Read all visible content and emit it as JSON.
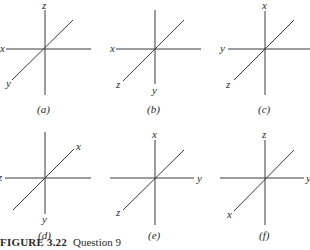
{
  "figure": {
    "caption_label": "FIGURE 3.22",
    "caption_text": "Question 9",
    "panels": [
      {
        "id": "a",
        "label": "(a)",
        "up": "z",
        "left": "x",
        "right": "",
        "down": "",
        "diag_low": "y",
        "diag_high": ""
      },
      {
        "id": "b",
        "label": "(b)",
        "up": "",
        "left": "x",
        "right": "",
        "down": "y",
        "diag_low": "z",
        "diag_high": ""
      },
      {
        "id": "c",
        "label": "(c)",
        "up": "x",
        "left": "y",
        "right": "",
        "down": "",
        "diag_low": "z",
        "diag_high": ""
      },
      {
        "id": "d",
        "label": "(d)",
        "up": "",
        "left": "z",
        "right": "",
        "down": "y",
        "diag_low": "",
        "diag_high": "x"
      },
      {
        "id": "e",
        "label": "(e)",
        "up": "x",
        "left": "",
        "right": "y",
        "down": "",
        "diag_low": "z",
        "diag_high": ""
      },
      {
        "id": "f",
        "label": "(f)",
        "up": "z",
        "left": "",
        "right": "y",
        "down": "",
        "diag_low": "x",
        "diag_high": ""
      }
    ]
  }
}
